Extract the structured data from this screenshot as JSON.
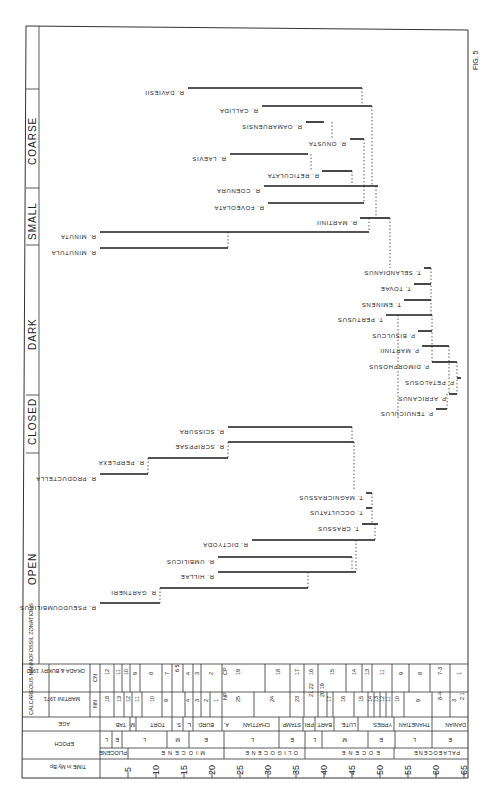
{
  "figure": {
    "label": "FIG. 5",
    "categories": [
      {
        "label": "OPEN"
      },
      {
        "label": "CLOSED"
      },
      {
        "label": "DARK"
      },
      {
        "label": "SMALL"
      },
      {
        "label": "COARSE"
      }
    ],
    "species": [
      {
        "name": "R. PSEUDOUMBILICUS"
      },
      {
        "name": "R. GARTNERI"
      },
      {
        "name": "R. HILLAE"
      },
      {
        "name": "R. UMBILICUS"
      },
      {
        "name": "R. DICTYODA"
      },
      {
        "name": "T. CRASSUS"
      },
      {
        "name": "T. OCCULTATUS"
      },
      {
        "name": "T. MAGNICRASSUS"
      },
      {
        "name": "R. PRODUCTELLA"
      },
      {
        "name": "R. PERPLEXA"
      },
      {
        "name": "R. SCRIPPSAE"
      },
      {
        "name": "R. SCISSURA"
      },
      {
        "name": "P. TENUICULUS"
      },
      {
        "name": "P. AFRICANUS"
      },
      {
        "name": "P. PETALOSUS"
      },
      {
        "name": "P. DIMORPHOSUS"
      },
      {
        "name": "P. MARTINII"
      },
      {
        "name": "P. BISULCUS"
      },
      {
        "name": "T. PERTUSUS"
      },
      {
        "name": "T. EMINENS"
      },
      {
        "name": "T. TOVAE"
      },
      {
        "name": "T. SELANDIANUS"
      },
      {
        "name": "R. MINUTULA"
      },
      {
        "name": "R. MINUTA"
      },
      {
        "name": "R. MARTINII"
      },
      {
        "name": "R. FOVEOLATA"
      },
      {
        "name": "R. COENURA"
      },
      {
        "name": "R. RETICULATA"
      },
      {
        "name": "R. LAEVIS"
      },
      {
        "name": "R. ONUSTA"
      },
      {
        "name": "R. OAMARUENSIS"
      },
      {
        "name": "R. CALLIDA"
      },
      {
        "name": "R. DAVIESII"
      }
    ],
    "table": {
      "header_zonations": "CALCAREOUS NANNOFOSSIL ZONATIONS",
      "okada_label": "OKADA & BUKRY 1980",
      "martini_label": "MARTINI 1971",
      "cn_label": "CN",
      "nn_label": "NN",
      "age_label": "AGE",
      "epoch_label": "EPOCH",
      "time_label": "TIME in My Bp",
      "cn_zones": [
        "12",
        "11",
        "10",
        "9",
        "8",
        "7",
        "6 5",
        "4",
        "3",
        "2",
        "1",
        "CP",
        "19",
        "18",
        "17",
        "16",
        "15",
        "14",
        "13",
        "12",
        "11",
        "10",
        "9",
        "8",
        "7-3",
        "2",
        "1"
      ],
      "nn_zones": [
        "18",
        "13",
        "12",
        "11",
        "10",
        "9",
        "8",
        "7 5",
        "4",
        "3",
        "2",
        "1",
        "NP",
        "25",
        "24",
        "23",
        "21 22",
        "20 19",
        "18",
        "17",
        "16",
        "15",
        "14",
        "13",
        "12",
        "11",
        "10",
        "9",
        "8-4",
        "3",
        "2 1"
      ],
      "ages": [
        "TAB.",
        "M",
        "TORT.",
        "S.",
        "L.",
        "BURD.",
        "A.",
        "CHATTIAN",
        "STAMP.",
        "PRI.",
        "BART.",
        "LUTE.",
        "YPRES.",
        "THANETIAN",
        "DANIAN"
      ],
      "epoch_subdivisions": [
        "L",
        "E",
        "L",
        "M",
        "E",
        "L",
        "E",
        "L",
        "M",
        "E",
        "L",
        "E"
      ],
      "epochs": [
        "PLIOCENE",
        "MIOCENE",
        "OLIGOCENE",
        "EOCENE",
        "PALAEOCENE"
      ],
      "time_ticks": [
        "5",
        "10",
        "15",
        "20",
        "25",
        "30",
        "35",
        "40",
        "45",
        "50",
        "55",
        "60",
        "65"
      ]
    }
  }
}
